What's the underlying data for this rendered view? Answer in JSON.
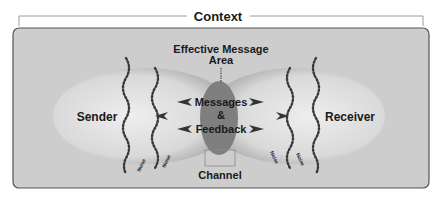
{
  "title": "Context",
  "labels": {
    "sender": "Sender",
    "receiver": "Receiver",
    "effective_area_line1": "Effective Message",
    "effective_area_line2": "Area",
    "messages": "Messages",
    "ampersand": "&",
    "feedback": "Feedback",
    "channel": "Channel",
    "noise": "Noise"
  },
  "colors": {
    "panel": "#cfcfcf",
    "ellipse_light": "#e6e6e6",
    "ellipse_dark": "#9a9a9a",
    "overlap": "#7d7d7d",
    "text": "#1a1a1a"
  }
}
